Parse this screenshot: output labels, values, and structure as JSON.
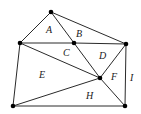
{
  "diagram": {
    "type": "planar-graph-regions",
    "vertices": [
      {
        "id": "top",
        "x": 51,
        "y": 12
      },
      {
        "id": "left-mid",
        "x": 20,
        "y": 43
      },
      {
        "id": "center-top",
        "x": 74,
        "y": 43
      },
      {
        "id": "right-top",
        "x": 126,
        "y": 44
      },
      {
        "id": "center",
        "x": 100,
        "y": 78
      },
      {
        "id": "bottom-left",
        "x": 13,
        "y": 106
      },
      {
        "id": "bottom-right",
        "x": 125,
        "y": 106
      }
    ],
    "edges": [
      [
        "top",
        "left-mid"
      ],
      [
        "top",
        "right-top"
      ],
      [
        "top",
        "center-top"
      ],
      [
        "left-mid",
        "center-top"
      ],
      [
        "center-top",
        "right-top"
      ],
      [
        "left-mid",
        "center"
      ],
      [
        "center-top",
        "center"
      ],
      [
        "right-top",
        "center"
      ],
      [
        "left-mid",
        "bottom-left"
      ],
      [
        "bottom-left",
        "center"
      ],
      [
        "center",
        "bottom-right"
      ],
      [
        "right-top",
        "bottom-right"
      ],
      [
        "bottom-left",
        "bottom-right"
      ]
    ],
    "regions": [
      {
        "label": "A",
        "x": 46,
        "y": 33
      },
      {
        "label": "B",
        "x": 76,
        "y": 37
      },
      {
        "label": "C",
        "x": 63,
        "y": 56
      },
      {
        "label": "D",
        "x": 99,
        "y": 59
      },
      {
        "label": "E",
        "x": 39,
        "y": 78
      },
      {
        "label": "F",
        "x": 111,
        "y": 80
      },
      {
        "label": "H",
        "x": 86,
        "y": 99
      },
      {
        "label": "I",
        "x": 130,
        "y": 81
      }
    ]
  }
}
